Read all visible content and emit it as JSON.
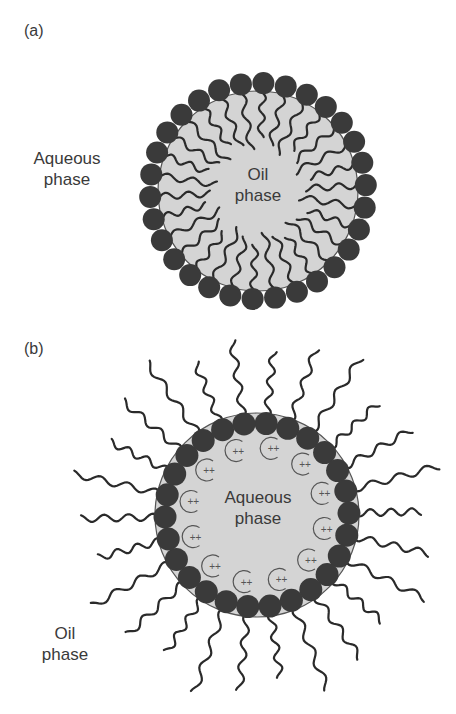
{
  "figure": {
    "panel_a": {
      "label": "(a)",
      "outer_label_line1": "Aqueous",
      "outer_label_line2": "phase",
      "inner_label_line1": "Oil",
      "inner_label_line2": "phase",
      "type": "oil-in-water micelle",
      "surfactant_count": 30
    },
    "panel_b": {
      "label": "(b)",
      "outer_label_line1": "Oil",
      "outer_label_line2": "phase",
      "inner_label_line1": "Aqueous",
      "inner_label_line2": "phase",
      "type": "reverse micelle",
      "surfactant_count": 26,
      "ion_symbol": "++",
      "ion_count": 12
    },
    "colors": {
      "background": "#ffffff",
      "droplet_fill": "#d4d4d4",
      "head_fill": "#3a3a3a",
      "tail_stroke": "#2a2a2a",
      "text": "#3a3a3a"
    }
  }
}
